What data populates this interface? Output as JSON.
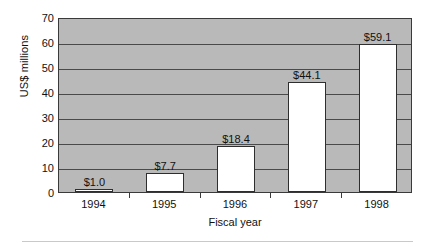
{
  "chart_data": {
    "type": "bar",
    "title": "",
    "subtitle": "",
    "xlabel": "Fiscal year",
    "ylabel": "US$ millions",
    "categories": [
      "1994",
      "1995",
      "1996",
      "1997",
      "1998"
    ],
    "values": [
      1.0,
      7.7,
      18.4,
      44.1,
      59.1
    ],
    "data_labels": [
      "$1.0",
      "$7.7",
      "$18.4",
      "$44.1",
      "$59.1"
    ],
    "series": [
      {
        "name": "Revenue",
        "values": [
          1.0,
          7.7,
          18.4,
          44.1,
          59.1
        ]
      }
    ],
    "ylim": [
      0,
      70
    ],
    "xlim_categories": 5,
    "y_ticks": [
      0,
      10,
      20,
      30,
      40,
      50,
      60,
      70
    ],
    "y_tick_labels": [
      "0",
      "10",
      "20",
      "30",
      "40",
      "50",
      "60",
      "70"
    ],
    "grid": true,
    "grid_axis": "y",
    "legend": false,
    "legend_position": "none",
    "colors": {
      "plot_background": "#b9b9b9",
      "bar_fill": "#ffffff",
      "bar_border": "#2e2e2e",
      "gridline": "#4a4a4a",
      "axis": "#3a3a3a",
      "text": "#111111",
      "page_background": "#ffffff",
      "bottom_rule": "#c9c9c9"
    }
  }
}
